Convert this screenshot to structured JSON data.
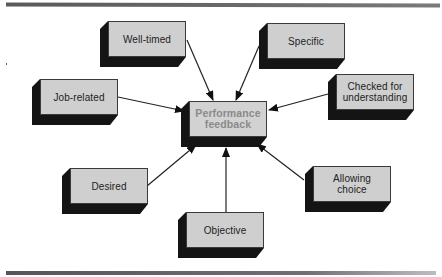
{
  "diagram": {
    "type": "hub-and-spoke",
    "center": {
      "id": "center",
      "label": "Performance feedback",
      "lines": [
        "Performance",
        "feedback"
      ],
      "text_color": "#8a8a8a"
    },
    "nodes": [
      {
        "id": "well-timed",
        "label": "Well-timed",
        "lines": [
          "Well-timed"
        ]
      },
      {
        "id": "specific",
        "label": "Specific",
        "lines": [
          "Specific"
        ]
      },
      {
        "id": "job-related",
        "label": "Job-related",
        "lines": [
          "Job-related"
        ]
      },
      {
        "id": "checked",
        "label": "Checked for understanding",
        "lines": [
          "Checked for",
          "understanding"
        ]
      },
      {
        "id": "desired",
        "label": "Desired",
        "lines": [
          "Desired"
        ]
      },
      {
        "id": "allowing-choice",
        "label": "Allowing choice",
        "lines": [
          "Allowing",
          "choice"
        ]
      },
      {
        "id": "objective",
        "label": "Objective",
        "lines": [
          "Objective"
        ]
      }
    ],
    "edges": [
      {
        "from": "well-timed",
        "to": "center"
      },
      {
        "from": "specific",
        "to": "center"
      },
      {
        "from": "job-related",
        "to": "center"
      },
      {
        "from": "checked",
        "to": "center"
      },
      {
        "from": "desired",
        "to": "center"
      },
      {
        "from": "allowing-choice",
        "to": "center"
      },
      {
        "from": "objective",
        "to": "center"
      }
    ],
    "colors": {
      "box_face": "#cfcfcf",
      "box_shadow": "#141414",
      "text": "#222222",
      "rule": "#5a5a5a"
    }
  }
}
